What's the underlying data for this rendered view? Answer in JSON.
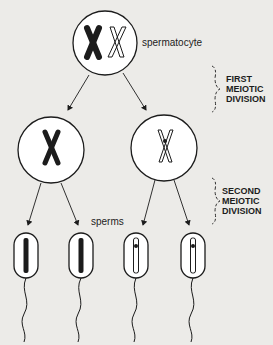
{
  "diagram": {
    "type": "meiosis-spermatogenesis",
    "colors": {
      "background": "#ecebe8",
      "ink": "#1c1c1c",
      "open_fill": "#ffffff"
    },
    "labels": {
      "spermatocyte": "spermatocyte",
      "sperms": "sperms",
      "first_division": [
        "FIRST",
        "MEIOTIC",
        "DIVISION"
      ],
      "second_division": [
        "SECOND",
        "MEIOTIC",
        "DIVISION"
      ]
    },
    "nodes": [
      {
        "id": "spermatocyte",
        "chromosomes": [
          "dark-x",
          "open-x"
        ]
      },
      {
        "id": "cell-left",
        "chromosomes": [
          "dark-x"
        ]
      },
      {
        "id": "cell-right",
        "chromosomes": [
          "open-x"
        ]
      },
      {
        "id": "sperm-1",
        "chromatid": "dark"
      },
      {
        "id": "sperm-2",
        "chromatid": "dark"
      },
      {
        "id": "sperm-3",
        "chromatid": "open"
      },
      {
        "id": "sperm-4",
        "chromatid": "open"
      }
    ],
    "edges": [
      [
        "spermatocyte",
        "cell-left"
      ],
      [
        "spermatocyte",
        "cell-right"
      ],
      [
        "cell-left",
        "sperm-1"
      ],
      [
        "cell-left",
        "sperm-2"
      ],
      [
        "cell-right",
        "sperm-3"
      ],
      [
        "cell-right",
        "sperm-4"
      ]
    ]
  }
}
